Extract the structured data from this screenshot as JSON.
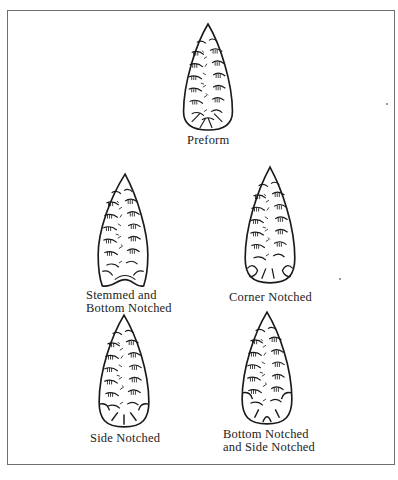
{
  "figure": {
    "type": "projectile point typology illustration",
    "line_color": "#1a1a1a",
    "frame_color": "#6f6f6f",
    "points": [
      {
        "id": "preform",
        "label_lines": [
          "Preform"
        ],
        "notching": "none"
      },
      {
        "id": "stemmed-bottom-notched",
        "label_lines": [
          "Stemmed and",
          "Bottom Notched"
        ],
        "notching": "stemmed-bottom"
      },
      {
        "id": "corner-notched",
        "label_lines": [
          "Corner Notched"
        ],
        "notching": "corner"
      },
      {
        "id": "side-notched",
        "label_lines": [
          "Side Notched"
        ],
        "notching": "side"
      },
      {
        "id": "bottom-and-side-notched",
        "label_lines": [
          "Bottom Notched",
          "and Side Notched"
        ],
        "notching": "bottom-side"
      }
    ]
  }
}
